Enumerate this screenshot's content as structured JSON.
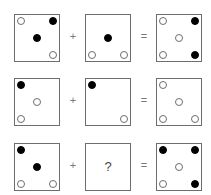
{
  "operators": {
    "plus": "+",
    "equals": "="
  },
  "unknown_symbol": "?",
  "rows": [
    {
      "a": [
        {
          "pos": "tl",
          "fill": "empty"
        },
        {
          "pos": "tr",
          "fill": "filled"
        },
        {
          "pos": "c",
          "fill": "filled"
        },
        {
          "pos": "br",
          "fill": "empty"
        }
      ],
      "b": [
        {
          "pos": "c",
          "fill": "filled"
        },
        {
          "pos": "bl",
          "fill": "empty"
        },
        {
          "pos": "br",
          "fill": "empty"
        }
      ],
      "result": [
        {
          "pos": "tl",
          "fill": "empty"
        },
        {
          "pos": "tr",
          "fill": "filled"
        },
        {
          "pos": "c",
          "fill": "empty"
        },
        {
          "pos": "bl",
          "fill": "empty"
        },
        {
          "pos": "br",
          "fill": "filled"
        }
      ]
    },
    {
      "a": [
        {
          "pos": "tl",
          "fill": "filled"
        },
        {
          "pos": "c",
          "fill": "empty"
        },
        {
          "pos": "bl",
          "fill": "empty"
        }
      ],
      "b": [
        {
          "pos": "tl",
          "fill": "filled"
        },
        {
          "pos": "br",
          "fill": "empty"
        }
      ],
      "result": [
        {
          "pos": "tl",
          "fill": "empty"
        },
        {
          "pos": "c",
          "fill": "empty"
        },
        {
          "pos": "bl",
          "fill": "empty"
        },
        {
          "pos": "br",
          "fill": "empty"
        }
      ]
    },
    {
      "a": [
        {
          "pos": "tl",
          "fill": "filled"
        },
        {
          "pos": "c",
          "fill": "filled"
        },
        {
          "pos": "bl",
          "fill": "empty"
        },
        {
          "pos": "br",
          "fill": "empty"
        }
      ],
      "b": "unknown",
      "result": [
        {
          "pos": "tl",
          "fill": "filled"
        },
        {
          "pos": "tr",
          "fill": "filled"
        },
        {
          "pos": "c",
          "fill": "empty"
        },
        {
          "pos": "bl",
          "fill": "empty"
        },
        {
          "pos": "br",
          "fill": "filled"
        }
      ]
    }
  ]
}
